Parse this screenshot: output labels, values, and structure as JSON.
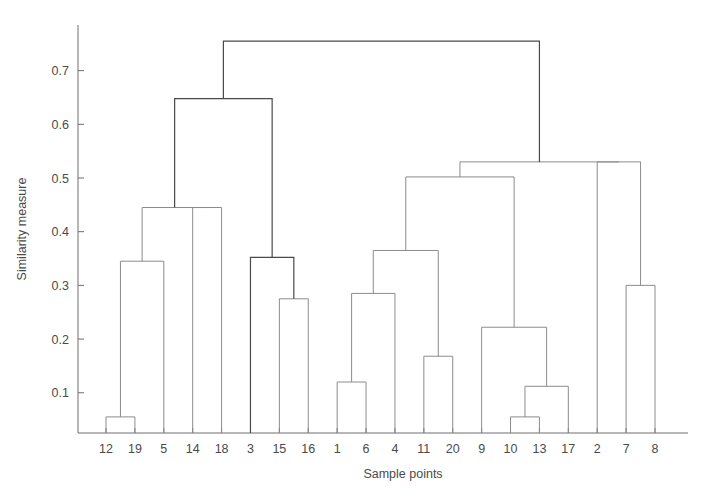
{
  "figure": {
    "title": "",
    "background_color": "#ffffff",
    "line_color": "#8c8c8c",
    "root_line_color": "#4a4a4a",
    "text_color": "#4a4a4a"
  },
  "axes": {
    "y_title": "Similarity measure",
    "x_title": "Sample points",
    "y_ticks": [
      "0.1",
      "0.2",
      "0.3",
      "0.4",
      "0.5",
      "0.6",
      "0.7"
    ],
    "y_tick_values": [
      0.1,
      0.2,
      0.3,
      0.4,
      0.5,
      0.6,
      0.7
    ],
    "y_min": 0.025,
    "y_max": 0.785,
    "x_leaf_labels": [
      "12",
      "19",
      "5",
      "14",
      "18",
      "3",
      "15",
      "16",
      "1",
      "6",
      "4",
      "11",
      "20",
      "9",
      "10",
      "13",
      "17",
      "2",
      "7",
      "8"
    ]
  },
  "chart_data": {
    "type": "dendrogram",
    "title": "",
    "xlabel": "Sample points",
    "ylabel": "Similarity measure",
    "ylim": [
      0.025,
      0.785
    ],
    "grid": false,
    "legend": null,
    "leaf_order": [
      "12",
      "19",
      "5",
      "14",
      "18",
      "3",
      "15",
      "16",
      "1",
      "6",
      "4",
      "11",
      "20",
      "9",
      "10",
      "13",
      "17",
      "2",
      "7",
      "8"
    ],
    "y_tick_labels": [
      "0.1",
      "0.2",
      "0.3",
      "0.4",
      "0.5",
      "0.6",
      "0.7"
    ],
    "merges": [
      {
        "id": "m1",
        "left": "12",
        "right": "19",
        "height": 0.055
      },
      {
        "id": "m2",
        "left": "m1",
        "right": "5",
        "height": 0.345
      },
      {
        "id": "m3",
        "left": "m2",
        "right": "m4",
        "height": 0.445
      },
      {
        "id": "m4",
        "left": "14",
        "right": "18",
        "height": 0.445
      },
      {
        "id": "m5",
        "left": "15",
        "right": "16",
        "height": 0.275
      },
      {
        "id": "m6",
        "left": "3",
        "right": "m5",
        "height": 0.352
      },
      {
        "id": "m7",
        "left": "m3",
        "right": "m6",
        "height": 0.648
      },
      {
        "id": "m8",
        "left": "1",
        "right": "6",
        "height": 0.12
      },
      {
        "id": "m9",
        "left": "m8",
        "right": "4",
        "height": 0.285
      },
      {
        "id": "m10",
        "left": "11",
        "right": "20",
        "height": 0.168
      },
      {
        "id": "m11",
        "left": "m9",
        "right": "m10",
        "height": 0.365
      },
      {
        "id": "m12",
        "left": "10",
        "right": "13",
        "height": 0.055
      },
      {
        "id": "m13",
        "left": "m12",
        "right": "17",
        "height": 0.112
      },
      {
        "id": "m14",
        "left": "9",
        "right": "m13",
        "height": 0.222
      },
      {
        "id": "m15",
        "left": "m11",
        "right": "m14",
        "height": 0.502
      },
      {
        "id": "m16",
        "left": "7",
        "right": "8",
        "height": 0.3
      },
      {
        "id": "m17",
        "left": "2",
        "right": "m16",
        "height": 0.53
      },
      {
        "id": "m18",
        "left": "m15",
        "right": "m17",
        "height": 0.53
      },
      {
        "id": "root",
        "left": "m7",
        "right": "m18",
        "height": 0.755
      }
    ]
  }
}
